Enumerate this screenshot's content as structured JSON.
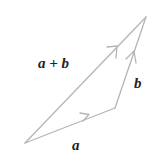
{
  "diagram": {
    "stroke_color": "#b5b5b5",
    "label_color": "#222222",
    "points": {
      "origin": [
        25,
        143
      ],
      "a_end": [
        115,
        108
      ],
      "sum_end": [
        146,
        17
      ]
    },
    "vectors": [
      {
        "id": "a",
        "label": "a",
        "from": "origin",
        "to": "a_end"
      },
      {
        "id": "b",
        "label": "b",
        "from": "a_end",
        "to": "sum_end"
      },
      {
        "id": "a_plus_b",
        "label": "a + b",
        "from": "origin",
        "to": "sum_end"
      }
    ],
    "labels": {
      "a": "a",
      "b": "b",
      "a_plus_b": "a + b"
    }
  }
}
